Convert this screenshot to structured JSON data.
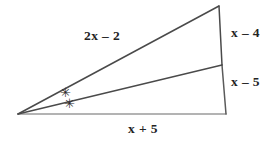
{
  "figure": {
    "kind": "triangle-with-angle-bisector",
    "background_color": "#ffffff",
    "stroke_color_dark": "#3a3a3a",
    "stroke_color_light": "#9a9a9a",
    "text_color": "#232323",
    "vertices": {
      "apex_left": {
        "x": 18,
        "y": 114
      },
      "top_right": {
        "x": 219,
        "y": 6
      },
      "bottom_right": {
        "x": 226,
        "y": 114
      },
      "cevian_foot": {
        "x": 222,
        "y": 65
      }
    },
    "segments": [
      {
        "name": "long-side",
        "from": "apex_left",
        "to": "top_right"
      },
      {
        "name": "base",
        "from": "apex_left",
        "to": "bottom_right"
      },
      {
        "name": "right-side-upper",
        "from": "top_right",
        "to": "cevian_foot"
      },
      {
        "name": "right-side-lower",
        "from": "cevian_foot",
        "to": "bottom_right"
      },
      {
        "name": "angle-bisector",
        "from": "apex_left",
        "to": "cevian_foot"
      }
    ]
  },
  "labels": {
    "long_side": "2x – 2",
    "base": "x + 5",
    "upper_right_side": "x – 4",
    "lower_right_side": "x – 5"
  },
  "angle_marks": {
    "upper": "✳",
    "lower": "✳",
    "count": 2,
    "meaning": "congruent-angles"
  }
}
